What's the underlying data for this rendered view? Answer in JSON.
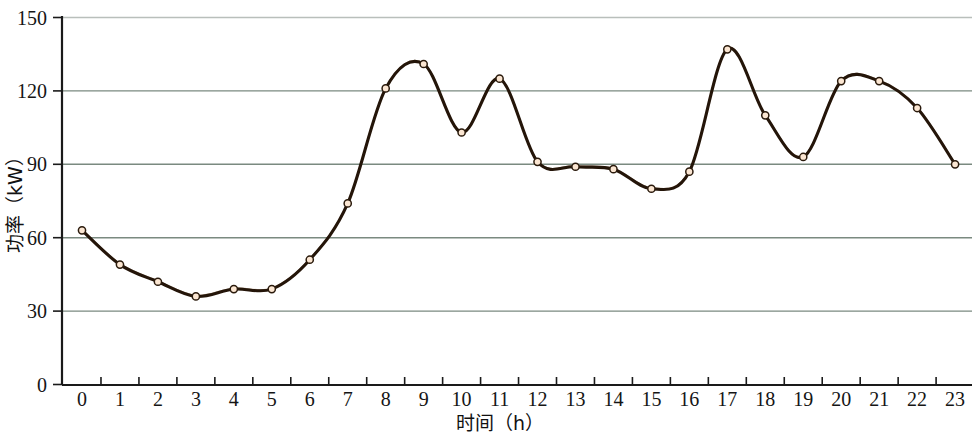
{
  "chart_data": {
    "type": "line",
    "title": "",
    "xlabel": "时间（h）",
    "ylabel": "功率（kW）",
    "x": [
      0,
      1,
      2,
      3,
      4,
      5,
      6,
      7,
      8,
      9,
      10,
      11,
      12,
      13,
      14,
      15,
      16,
      17,
      18,
      19,
      20,
      21,
      22,
      23
    ],
    "values": [
      63,
      49,
      42,
      36,
      39,
      39,
      51,
      74,
      121,
      131,
      103,
      125,
      91,
      89,
      88,
      80,
      87,
      137,
      110,
      93,
      124,
      124,
      113,
      90
    ],
    "series": [
      {
        "name": "功率",
        "values": [
          63,
          49,
          42,
          36,
          39,
          39,
          51,
          74,
          121,
          131,
          103,
          125,
          91,
          89,
          88,
          80,
          87,
          137,
          110,
          93,
          124,
          124,
          113,
          90
        ]
      }
    ],
    "xticklabels": [
      "0",
      "1",
      "2",
      "3",
      "4",
      "5",
      "6",
      "7",
      "8",
      "9",
      "10",
      "11",
      "12",
      "13",
      "14",
      "15",
      "16",
      "17",
      "18",
      "19",
      "20",
      "21",
      "22",
      "23"
    ],
    "yticklabels": [
      "0",
      "30",
      "60",
      "90",
      "120",
      "150"
    ],
    "yticks": [
      0,
      30,
      60,
      90,
      120,
      150
    ],
    "xlim": [
      0,
      23
    ],
    "ylim": [
      0,
      150
    ],
    "grid": true,
    "grid_axis": "y",
    "legend": false,
    "legend_position": "none",
    "line_color": "#241509",
    "marker_fill_color": "#fbe6d2",
    "marker_edge_color": "#2a1a0c",
    "gridline_color": "#7a8a80",
    "axis_color": "#1a1a1a",
    "interpolation": "smooth-spline",
    "marker": "circle"
  },
  "axes": {
    "y_axis_title": "功率（kW）",
    "x_axis_title": "时间（h）"
  }
}
